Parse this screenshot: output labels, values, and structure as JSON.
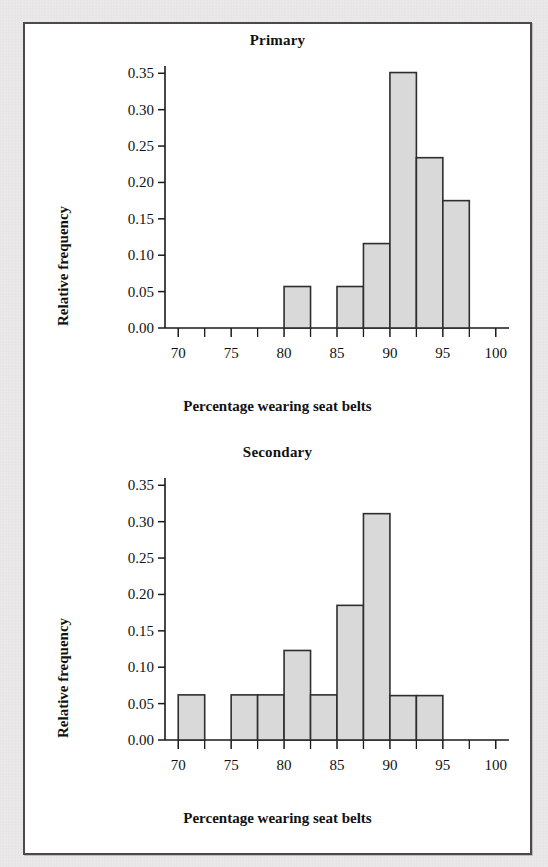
{
  "figure": {
    "xlabel": "Percentage wearing seat belts",
    "ylabel": "Relative frequency",
    "bar_fill": "#d9d9d9",
    "bar_stroke": "#2e2e2e",
    "axis_color": "#1a1a1a"
  },
  "panels": [
    {
      "title": "Primary"
    },
    {
      "title": "Secondary"
    }
  ],
  "chart_data": [
    {
      "type": "bar",
      "title": "Primary",
      "xlabel": "Percentage wearing seat belts",
      "ylabel": "Relative frequency",
      "xlim": [
        68.75,
        101.25
      ],
      "ylim": [
        0.0,
        0.36
      ],
      "xticks": [
        70,
        75,
        80,
        85,
        90,
        95,
        100
      ],
      "xtick_labels": [
        "70",
        "75",
        "80",
        "85",
        "90",
        "95",
        "100"
      ],
      "minor_xticks": [
        72.5,
        77.5,
        82.5,
        87.5,
        92.5,
        97.5
      ],
      "yticks": [
        0.0,
        0.05,
        0.1,
        0.15,
        0.2,
        0.25,
        0.3,
        0.35
      ],
      "ytick_labels": [
        "0.00",
        "0.05",
        "0.10",
        "0.15",
        "0.20",
        "0.25",
        "0.30",
        "0.35"
      ],
      "bin_width": 2.5,
      "bins": [
        {
          "x0": 80.0,
          "x1": 82.5,
          "value": 0.057
        },
        {
          "x0": 85.0,
          "x1": 87.5,
          "value": 0.057
        },
        {
          "x0": 87.5,
          "x1": 90.0,
          "value": 0.116
        },
        {
          "x0": 90.0,
          "x1": 92.5,
          "value": 0.351
        },
        {
          "x0": 92.5,
          "x1": 95.0,
          "value": 0.234
        },
        {
          "x0": 95.0,
          "x1": 97.5,
          "value": 0.175
        }
      ],
      "grid": false,
      "legend": "none"
    },
    {
      "type": "bar",
      "title": "Secondary",
      "xlabel": "Percentage wearing seat belts",
      "ylabel": "Relative frequency",
      "xlim": [
        68.75,
        101.25
      ],
      "ylim": [
        0.0,
        0.36
      ],
      "xticks": [
        70,
        75,
        80,
        85,
        90,
        95,
        100
      ],
      "xtick_labels": [
        "70",
        "75",
        "80",
        "85",
        "90",
        "95",
        "100"
      ],
      "minor_xticks": [
        72.5,
        77.5,
        82.5,
        87.5,
        92.5,
        97.5
      ],
      "yticks": [
        0.0,
        0.05,
        0.1,
        0.15,
        0.2,
        0.25,
        0.3,
        0.35
      ],
      "ytick_labels": [
        "0.00",
        "0.05",
        "0.10",
        "0.15",
        "0.20",
        "0.25",
        "0.30",
        "0.35"
      ],
      "bin_width": 2.5,
      "bins": [
        {
          "x0": 70.0,
          "x1": 72.5,
          "value": 0.062
        },
        {
          "x0": 75.0,
          "x1": 77.5,
          "value": 0.062
        },
        {
          "x0": 77.5,
          "x1": 80.0,
          "value": 0.062
        },
        {
          "x0": 80.0,
          "x1": 82.5,
          "value": 0.123
        },
        {
          "x0": 82.5,
          "x1": 85.0,
          "value": 0.062
        },
        {
          "x0": 85.0,
          "x1": 87.5,
          "value": 0.185
        },
        {
          "x0": 87.5,
          "x1": 90.0,
          "value": 0.311
        },
        {
          "x0": 90.0,
          "x1": 92.5,
          "value": 0.061
        },
        {
          "x0": 92.5,
          "x1": 95.0,
          "value": 0.061
        }
      ],
      "grid": false,
      "legend": "none"
    }
  ]
}
